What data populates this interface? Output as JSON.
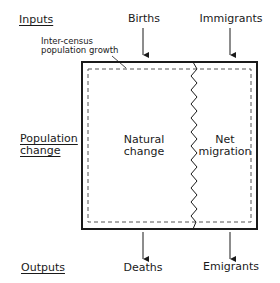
{
  "diagram": {
    "row_labels": {
      "inputs": "Inputs",
      "population_change_line1": "Population",
      "population_change_line2": "change",
      "outputs": "Outputs"
    },
    "inputs": {
      "births": "Births",
      "immigrants": "Immigrants"
    },
    "outputs": {
      "deaths": "Deaths",
      "emigrants": "Emigrants"
    },
    "annotation": {
      "line1": "Inter-census",
      "line2": "population growth"
    },
    "regions": {
      "natural_change_line1": "Natural",
      "natural_change_line2": "change",
      "net_migration_line1": "Net",
      "net_migration_line2": "migration"
    },
    "colors": {
      "line": "#1a1a1a",
      "dashed": "#555555",
      "background": "#ffffff"
    }
  }
}
